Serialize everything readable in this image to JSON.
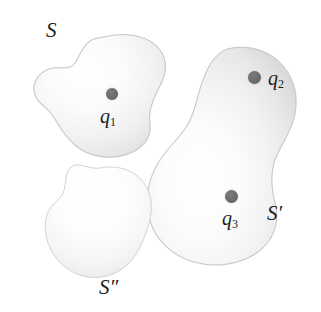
{
  "figure": {
    "background_color": "#ffffff",
    "width": 321,
    "height": 312,
    "dot_color": "#6b6b6b",
    "blob_fill_color": "#f4f4f4",
    "blob_edge_color": "#c9c9c9",
    "text_color": "#1c1c1c"
  },
  "labels": {
    "set_s": "S",
    "set_s_prime": "S′",
    "set_s_double_prime": "S″",
    "point_q1_base": "q",
    "point_q1_sub": "1",
    "point_q2_base": "q",
    "point_q2_sub": "2",
    "point_q3_base": "q",
    "point_q3_sub": "3"
  },
  "regions": [
    {
      "name": "S",
      "label": "S",
      "description": "upper-left kidney-shaped region",
      "contains_points": [
        "q1"
      ]
    },
    {
      "name": "S-prime",
      "label": "S′",
      "description": "large right pear-shaped region",
      "contains_points": [
        "q2",
        "q3"
      ]
    },
    {
      "name": "S-double-prime",
      "label": "S″",
      "description": "lower-left kidney-shaped region",
      "contains_points": []
    }
  ],
  "points": [
    {
      "name": "q1",
      "label": "q1",
      "region": "S",
      "x": 112,
      "y": 94
    },
    {
      "name": "q2",
      "label": "q2",
      "region": "S′",
      "x": 255,
      "y": 78
    },
    {
      "name": "q3",
      "label": "q3",
      "region": "S′",
      "x": 232,
      "y": 197
    }
  ]
}
